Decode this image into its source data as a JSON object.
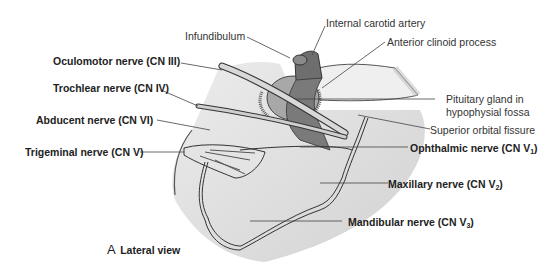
{
  "figure": {
    "panel_letter": "A",
    "caption": "Lateral view",
    "colors": {
      "bone_fill": "#e6e6e6",
      "bone_shadow": "#c9c9c9",
      "artery": "#7a7a7a",
      "gland": "#a9a9a9",
      "outline": "#333333",
      "leader": "#444444"
    }
  },
  "labels": {
    "infundibulum": "Infundibulum",
    "internal_carotid_artery": "Internal carotid artery",
    "anterior_clinoid_process": "Anterior clinoid process",
    "oculomotor_nerve": "Oculomotor nerve (CN III)",
    "trochlear_nerve": "Trochlear nerve (CN IV)",
    "abducent_nerve": "Abducent nerve (CN VI)",
    "trigeminal_nerve": "Trigeminal nerve (CN V)",
    "pituitary_line1": "Pituitary gland in",
    "pituitary_line2": "hypophysial fossa",
    "superior_orbital_fissure": "Superior orbital fissure",
    "ophthalmic_nerve": "Ophthalmic nerve (CN V",
    "ophthalmic_sub": "1",
    "maxillary_nerve": "Maxillary nerve (CN V",
    "maxillary_sub": "2",
    "mandibular_nerve": "Mandibular nerve (CN V",
    "mandibular_sub": "3",
    "close_paren": ")"
  }
}
